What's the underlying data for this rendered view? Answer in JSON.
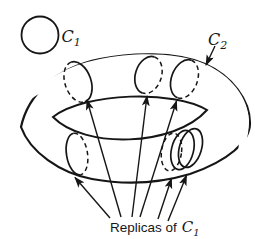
{
  "figure": {
    "background": "#ffffff",
    "ink": "#161616",
    "shade_gray": "#b9b9b9",
    "legend_label": {
      "base": "C",
      "subscript": "1"
    },
    "tube_label": {
      "base": "C",
      "subscript": "2"
    },
    "caption": {
      "prefix": "Replicas of",
      "base": "C",
      "subscript": "1"
    }
  }
}
